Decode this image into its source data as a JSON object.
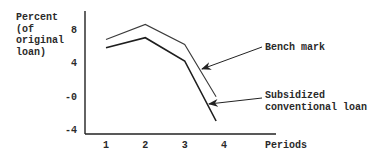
{
  "chart_data": {
    "type": "line",
    "title": "",
    "ylabel_lines": [
      "Percent",
      "(of",
      "original",
      "loan)"
    ],
    "xlabel": "Periods",
    "x": [
      1,
      2,
      3,
      3.8
    ],
    "xticks": [
      1,
      2,
      3,
      4
    ],
    "xtick_labels": [
      "1",
      "2",
      "3",
      "4"
    ],
    "yticks": [
      8,
      4,
      0,
      -4
    ],
    "ytick_labels": [
      "8",
      "4",
      "-0",
      "-4"
    ],
    "xlim": [
      0.45,
      5.3
    ],
    "ylim": [
      -4.6,
      10.2
    ],
    "grid": false,
    "series": [
      {
        "name": "Bench mark",
        "label_lines": [
          "Bench mark"
        ],
        "values": [
          6.8,
          8.6,
          6.2,
          -0.1
        ],
        "color": "#3a3a3a"
      },
      {
        "name": "Subsidized conventional loan",
        "label_lines": [
          "Subsidized",
          "conventional loan"
        ],
        "values": [
          5.8,
          7.0,
          4.2,
          -3.0
        ],
        "color": "#1e1e1e"
      }
    ],
    "annotations": [
      {
        "text": "Bench mark",
        "points_to_series": 0,
        "at_x": 3.4
      },
      {
        "text": "Subsidized conventional loan",
        "points_to_series": 1,
        "at_x": 3.7
      }
    ],
    "legend": "annotated-arrows-right"
  }
}
